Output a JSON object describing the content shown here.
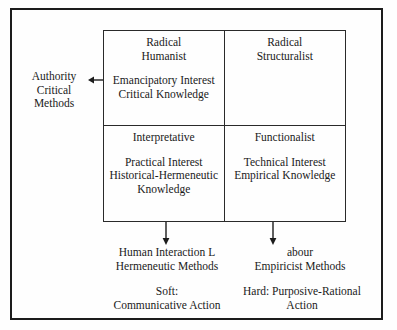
{
  "figure": {
    "frame_color": "#1c1c1c",
    "text_color": "#1a1a1a",
    "background": "#fefefe"
  },
  "side_label": {
    "text": "Authority\nCritical Methods",
    "arrow_icon": "arrow-left-icon"
  },
  "matrix": {
    "quadrants": [
      {
        "id": "radical-humanist",
        "heading": "Radical\nHumanist",
        "body": "Emancipatory Interest\nCritical Knowledge"
      },
      {
        "id": "radical-structuralist",
        "heading": "Radical\nStructuralist",
        "body": ""
      },
      {
        "id": "interpretative",
        "heading": "Interpretative",
        "body": "Practical Interest\nHistorical-Hermeneutic\nKnowledge"
      },
      {
        "id": "functionalist",
        "heading": "Functionalist",
        "body": "Technical Interest\nEmpirical Knowledge"
      }
    ]
  },
  "arrows": {
    "down_left_icon": "arrow-down-icon",
    "down_right_icon": "arrow-down-icon"
  },
  "captions": {
    "methods_left": "Human Interaction L\nHermeneutic Methods",
    "methods_right": "abour\nEmpiricist Methods",
    "paradigm_left": "Soft:\nCommunicative Action",
    "paradigm_right": "Hard: Purposive-Rational\nAction"
  }
}
